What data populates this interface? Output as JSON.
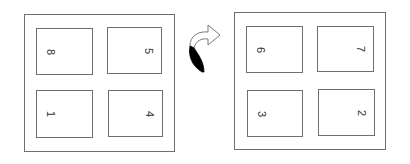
{
  "diagram": {
    "before": {
      "pages": [
        {
          "label": "8",
          "pos": "top-left"
        },
        {
          "label": "5",
          "pos": "top-right"
        },
        {
          "label": "1",
          "pos": "bottom-left"
        },
        {
          "label": "4",
          "pos": "bottom-right"
        }
      ]
    },
    "transition": {
      "icon": "flip-arrow-icon"
    },
    "after": {
      "pages": [
        {
          "label": "6",
          "pos": "top-left"
        },
        {
          "label": "7",
          "pos": "top-right"
        },
        {
          "label": "3",
          "pos": "bottom-left"
        },
        {
          "label": "2",
          "pos": "bottom-right"
        }
      ]
    }
  },
  "colors": {
    "border": "#6f6f6f",
    "text": "#333333",
    "arrow_fill": "#000000"
  }
}
